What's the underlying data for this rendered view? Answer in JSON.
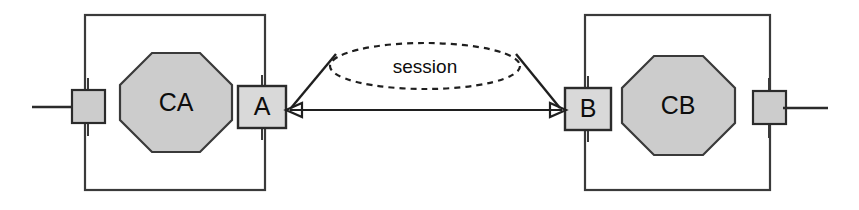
{
  "diagram": {
    "type": "component-interaction-diagram",
    "colors": {
      "shape_fill": "#cccccc",
      "interface_fill": "#d9d9d9",
      "stroke": "#2b2b2b",
      "background": "#ffffff"
    },
    "left_system": {
      "component_label": "CA",
      "interface_label": "A"
    },
    "right_system": {
      "component_label": "CB",
      "interface_label": "B"
    },
    "connector": {
      "label": "session",
      "style": "dashed-ellipse",
      "arrow": "double-headed"
    }
  }
}
